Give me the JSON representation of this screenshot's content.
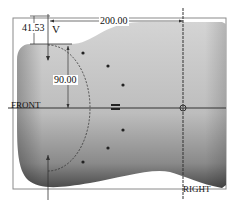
{
  "sketch": {
    "dimensions": [
      {
        "id": "dim-top-offset",
        "value": "41.53"
      },
      {
        "id": "dim-width",
        "value": "200.00"
      },
      {
        "id": "dim-arc-height",
        "value": "90.00"
      }
    ],
    "datums": {
      "vertical": "V",
      "front": "FRONT",
      "right": "RIGHT"
    },
    "colors": {
      "body_light": "#c8c8c8",
      "body_dark": "#505050",
      "line": "#222222",
      "frame": "#7a7a7a"
    }
  }
}
